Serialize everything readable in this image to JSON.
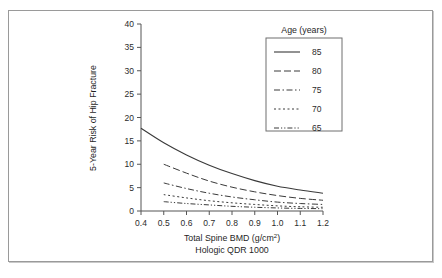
{
  "figure": {
    "background_color": "#ffffff",
    "frame_color": "#9a9a9a",
    "line_color": "#3a3a3a"
  },
  "axes": {
    "y_title": "5-Year Risk of Hip Fracture",
    "x_title_main": "Total Spine BMD (g/cm",
    "x_title_super": "2",
    "x_title_close": ")",
    "x_title_full": "Total Spine BMD (g/cm²)",
    "x_subtitle": "Hologic QDR 1000",
    "x_ticklabels": [
      "0.4",
      "0.5",
      "0.6",
      "0.7",
      "0.8",
      "0.9",
      "1.0",
      "1.1",
      "1.2"
    ],
    "y_ticklabels": [
      "0",
      "5",
      "10",
      "15",
      "20",
      "25",
      "30",
      "35",
      "40"
    ]
  },
  "legend": {
    "title": "Age (years)",
    "entries": [
      {
        "label": "85",
        "dash": "none",
        "style": "solid"
      },
      {
        "label": "80",
        "dash": "7,3",
        "style": "dashed"
      },
      {
        "label": "75",
        "dash": "6,2.5,1.5,2.5",
        "style": "dash-dot"
      },
      {
        "label": "70",
        "dash": "2,2.5",
        "style": "dotted"
      },
      {
        "label": "65",
        "dash": "5,2,1.2,2,1.2,2",
        "style": "dash-dot-dot"
      }
    ]
  },
  "chart_data": {
    "type": "line",
    "title": "",
    "xlabel": "Total Spine BMD (g/cm²)",
    "ylabel": "5-Year Risk of Hip Fracture",
    "xlim": [
      0.4,
      1.2
    ],
    "ylim": [
      0,
      40
    ],
    "xticks": [
      0.4,
      0.5,
      0.6,
      0.7,
      0.8,
      0.9,
      1.0,
      1.1,
      1.2
    ],
    "yticks": [
      0,
      5,
      10,
      15,
      20,
      25,
      30,
      35,
      40
    ],
    "grid": false,
    "legend_position": "top-right",
    "legend_title": "Age (years)",
    "series": [
      {
        "name": "85",
        "x": [
          0.4,
          0.5,
          0.6,
          0.7,
          0.8,
          0.9,
          1.0,
          1.1,
          1.2
        ],
        "values": [
          17.7,
          14.6,
          12.0,
          9.8,
          8.0,
          6.5,
          5.3,
          4.5,
          3.8
        ]
      },
      {
        "name": "80",
        "x": [
          0.5,
          0.6,
          0.7,
          0.8,
          0.9,
          1.0,
          1.1,
          1.2
        ],
        "values": [
          10.0,
          8.1,
          6.4,
          5.1,
          4.1,
          3.3,
          2.7,
          2.3
        ]
      },
      {
        "name": "75",
        "x": [
          0.5,
          0.6,
          0.7,
          0.8,
          0.9,
          1.0,
          1.1,
          1.2
        ],
        "values": [
          6.0,
          4.8,
          3.8,
          3.0,
          2.4,
          1.9,
          1.6,
          1.4
        ]
      },
      {
        "name": "70",
        "x": [
          0.5,
          0.6,
          0.7,
          0.8,
          0.9,
          1.0,
          1.1,
          1.2
        ],
        "values": [
          3.5,
          2.8,
          2.2,
          1.75,
          1.4,
          1.1,
          0.9,
          0.8
        ]
      },
      {
        "name": "65",
        "x": [
          0.5,
          0.6,
          0.7,
          0.8,
          0.9,
          1.0,
          1.1,
          1.2
        ],
        "values": [
          2.0,
          1.6,
          1.3,
          1.0,
          0.8,
          0.65,
          0.55,
          0.5
        ]
      }
    ]
  }
}
